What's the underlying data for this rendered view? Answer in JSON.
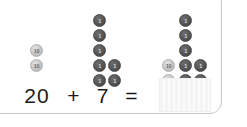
{
  "card": {
    "border_color": "#c9c9c9",
    "background": "#ffffff"
  },
  "equation": {
    "addend_a": "20",
    "operator_plus": "+",
    "addend_b": "7",
    "operator_equals": "=",
    "answer_value": "",
    "answer_placeholder": ""
  },
  "coins": {
    "ten_label": "10",
    "one_label": "1",
    "ten_color": "#c6c6c6",
    "one_color": "#555555"
  },
  "groups": [
    {
      "name": "first-addend-coins",
      "description": "20 shown as two ten-coins",
      "tens": 2,
      "ones": 0,
      "total": 20
    },
    {
      "name": "second-addend-coins",
      "description": "7 shown as seven one-coins",
      "tens": 0,
      "ones": 7,
      "total": 7
    },
    {
      "name": "sum-coins",
      "description": "27 shown as two ten-coins and seven one-coins",
      "tens": 2,
      "ones": 7,
      "total": 27
    }
  ]
}
